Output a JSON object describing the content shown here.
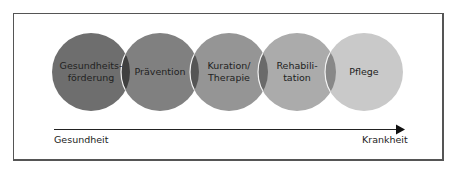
{
  "diagram": {
    "circles": [
      {
        "label_lines": [
          "Gesundheits-",
          "förderung"
        ],
        "color": "#6e6e6e",
        "cx": 91
      },
      {
        "label_lines": [
          "Prävention"
        ],
        "color": "#808080",
        "cx": 160
      },
      {
        "label_lines": [
          "Kuration/",
          "Therapie"
        ],
        "color": "#959595",
        "cx": 229
      },
      {
        "label_lines": [
          "Rehabili-",
          "tation"
        ],
        "color": "#ababab",
        "cx": 297
      },
      {
        "label_lines": [
          "Pflege"
        ],
        "color": "#c9c9c9",
        "cx": 364
      }
    ],
    "overlap_color": "#4a4a4a",
    "axis": {
      "start_label": "Gesundheit",
      "end_label": "Krankheit"
    }
  }
}
